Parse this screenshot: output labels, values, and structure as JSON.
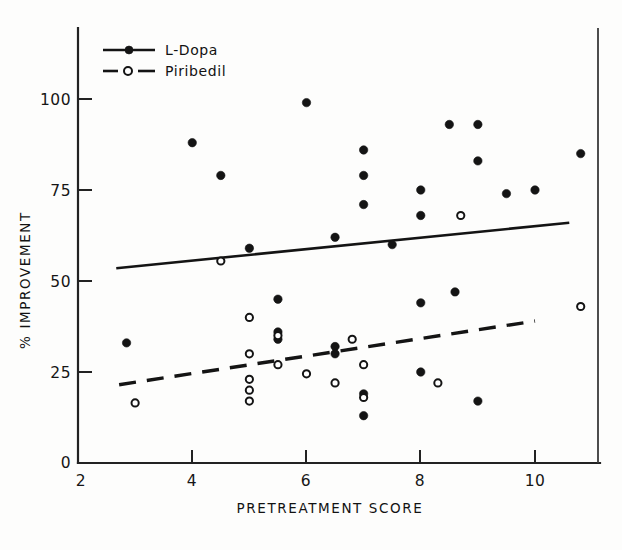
{
  "figure": {
    "background_color": "#fdfdfc",
    "ink_color": "#141414"
  },
  "legend": {
    "position": "top-left-inside",
    "entries": [
      {
        "label": "L-Dopa",
        "marker": "filled-circle",
        "line": "solid"
      },
      {
        "label": "Piribedil",
        "marker": "open-circle",
        "line": "dashed"
      }
    ]
  },
  "axes": {
    "x": {
      "title": "PRETREATMENT SCORE",
      "ticks": [
        "2",
        "4",
        "6",
        "8",
        "10"
      ],
      "tick_values": [
        2,
        4,
        6,
        8,
        10
      ],
      "range": [
        2,
        11.1
      ]
    },
    "y": {
      "title": "% IMPROVEMENT",
      "ticks": [
        "0",
        "25",
        "50",
        "75",
        "100"
      ],
      "tick_values": [
        0,
        25,
        50,
        75,
        100
      ],
      "range": [
        0,
        107
      ]
    }
  },
  "chart_data": {
    "type": "scatter",
    "title": "",
    "xlabel": "PRETREATMENT SCORE",
    "ylabel": "% IMPROVEMENT",
    "xlim": [
      2,
      11.1
    ],
    "ylim": [
      0,
      107
    ],
    "grid": false,
    "legend_position": "upper left",
    "series": [
      {
        "name": "L-Dopa",
        "marker": "filled-circle",
        "line": "solid",
        "points": [
          [
            2.85,
            33
          ],
          [
            4.0,
            88
          ],
          [
            4.5,
            79
          ],
          [
            5.0,
            59
          ],
          [
            5.5,
            45
          ],
          [
            5.5,
            36
          ],
          [
            5.5,
            34
          ],
          [
            6.0,
            99
          ],
          [
            6.5,
            62
          ],
          [
            6.5,
            32
          ],
          [
            6.5,
            30
          ],
          [
            7.0,
            86
          ],
          [
            7.0,
            79
          ],
          [
            7.0,
            71
          ],
          [
            7.0,
            19
          ],
          [
            7.0,
            13
          ],
          [
            7.5,
            60
          ],
          [
            8.0,
            75
          ],
          [
            8.0,
            68
          ],
          [
            8.0,
            44
          ],
          [
            8.0,
            25
          ],
          [
            8.5,
            93
          ],
          [
            8.6,
            47
          ],
          [
            9.0,
            93
          ],
          [
            9.0,
            83
          ],
          [
            9.0,
            17
          ],
          [
            9.5,
            74
          ],
          [
            10.0,
            75
          ],
          [
            10.8,
            85
          ]
        ]
      },
      {
        "name": "Piribedil",
        "marker": "open-circle",
        "line": "dashed",
        "points": [
          [
            3.0,
            16.5
          ],
          [
            4.5,
            55.5
          ],
          [
            5.0,
            40
          ],
          [
            5.0,
            30
          ],
          [
            5.0,
            23
          ],
          [
            5.0,
            20
          ],
          [
            5.0,
            17
          ],
          [
            5.5,
            35
          ],
          [
            5.5,
            27
          ],
          [
            6.0,
            24.5
          ],
          [
            6.5,
            22
          ],
          [
            6.8,
            34
          ],
          [
            7.0,
            27
          ],
          [
            7.0,
            18
          ],
          [
            8.3,
            22
          ],
          [
            8.7,
            68
          ],
          [
            10.8,
            43
          ]
        ]
      }
    ],
    "trend_lines": [
      {
        "series": "L-Dopa",
        "style": "solid",
        "x_start": 2.67,
        "y_start": 53.5,
        "x_end": 10.6,
        "y_end": 66
      },
      {
        "series": "Piribedil",
        "style": "dashed",
        "x_start": 2.72,
        "y_start": 21.5,
        "x_end": 10.0,
        "y_end": 39
      }
    ]
  }
}
